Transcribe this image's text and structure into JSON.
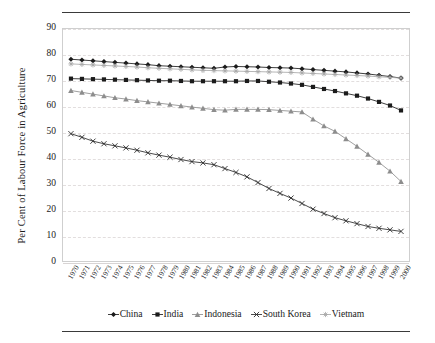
{
  "figure": {
    "background": "#ffffff",
    "rule_color": "#3a3a3a"
  },
  "chart_data": {
    "type": "line",
    "title": "",
    "subtitle": "",
    "xlabel": "",
    "ylabel": "Per Cent of Labour Force in Agriculture",
    "xlim": [
      1970,
      2000
    ],
    "ylim": [
      0,
      90
    ],
    "ytick_step": 10,
    "yticks": [
      0,
      10,
      20,
      30,
      40,
      50,
      60,
      70,
      80,
      90
    ],
    "grid": true,
    "grid_axis": "y",
    "legend_position": "bottom",
    "x": [
      1970,
      1971,
      1972,
      1973,
      1974,
      1975,
      1976,
      1977,
      1978,
      1979,
      1980,
      1981,
      1982,
      1983,
      1984,
      1985,
      1986,
      1987,
      1988,
      1989,
      1990,
      1991,
      1992,
      1993,
      1994,
      1995,
      1996,
      1997,
      1998,
      1999,
      2000
    ],
    "categories": [
      "1970",
      "1971",
      "1972",
      "1973",
      "1974",
      "1975",
      "1976",
      "1977",
      "1978",
      "1979",
      "1980",
      "1981",
      "1982",
      "1983",
      "1984",
      "1985",
      "1986",
      "1987",
      "1988",
      "1989",
      "1990",
      "1991",
      "1992",
      "1993",
      "1994",
      "1995",
      "1996",
      "1997",
      "1998",
      "1999",
      "2000"
    ],
    "series": [
      {
        "name": "China",
        "color": "#1b1b1b",
        "marker": "diamond",
        "values": [
          78.3,
          78.0,
          77.7,
          77.4,
          77.1,
          76.8,
          76.5,
          76.2,
          75.8,
          75.6,
          75.4,
          75.2,
          75.0,
          74.8,
          75.3,
          75.5,
          75.4,
          75.3,
          75.1,
          75.0,
          74.9,
          74.6,
          74.3,
          74.0,
          73.7,
          73.4,
          73.0,
          72.6,
          72.1,
          71.6,
          71.0
        ]
      },
      {
        "name": "India",
        "color": "#1b1b1b",
        "marker": "square",
        "values": [
          70.8,
          70.7,
          70.6,
          70.5,
          70.4,
          70.3,
          70.2,
          70.1,
          70.0,
          70.0,
          69.9,
          69.8,
          69.8,
          69.8,
          69.8,
          69.8,
          69.9,
          69.9,
          69.6,
          69.3,
          68.9,
          68.4,
          67.6,
          66.8,
          66.0,
          65.1,
          64.2,
          63.1,
          61.8,
          60.4,
          58.5
        ]
      },
      {
        "name": "Indonesia",
        "color": "#8d8d8d",
        "marker": "triangle",
        "values": [
          66.2,
          65.5,
          64.8,
          64.1,
          63.4,
          62.9,
          62.3,
          61.8,
          61.3,
          60.8,
          60.3,
          59.8,
          59.3,
          58.8,
          58.6,
          58.9,
          58.9,
          58.9,
          58.8,
          58.5,
          58.2,
          57.9,
          55.1,
          52.5,
          50.4,
          47.5,
          44.6,
          41.5,
          38.4,
          35.0,
          31.0
        ]
      },
      {
        "name": "South Korea",
        "color": "#2a2a2a",
        "marker": "cross",
        "values": [
          49.5,
          48.1,
          46.6,
          45.6,
          44.8,
          44.0,
          43.1,
          42.1,
          41.2,
          40.4,
          39.5,
          38.7,
          38.2,
          37.5,
          36.0,
          34.5,
          32.8,
          30.6,
          28.3,
          26.4,
          24.6,
          22.5,
          20.3,
          18.6,
          17.0,
          15.8,
          14.7,
          13.6,
          12.9,
          12.3,
          11.7
        ]
      },
      {
        "name": "Vietnam",
        "color": "#a9a9a9",
        "marker": "star",
        "values": [
          76.5,
          76.3,
          76.1,
          75.9,
          75.7,
          75.5,
          75.3,
          75.0,
          74.8,
          74.6,
          74.4,
          74.2,
          74.0,
          73.9,
          73.8,
          73.7,
          73.6,
          73.5,
          73.4,
          73.3,
          73.2,
          73.0,
          72.8,
          72.6,
          72.4,
          72.2,
          72.0,
          71.8,
          71.5,
          71.3,
          71.0
        ]
      }
    ]
  }
}
